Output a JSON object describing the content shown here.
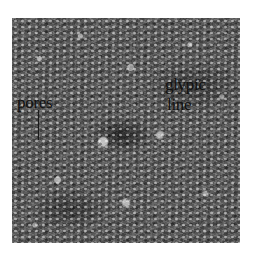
{
  "image": {
    "description": "Grayscale micrograph of textured surface",
    "annotations": [
      {
        "label": "pores"
      },
      {
        "label_line1": "glypic",
        "label_line2": "line"
      }
    ]
  }
}
